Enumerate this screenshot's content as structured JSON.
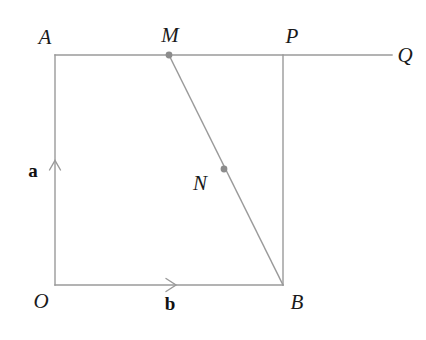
{
  "figure": {
    "background_color": "#ffffff",
    "line_color": "#9a9a9a",
    "point_color": "#8c8c8c",
    "label_color": "#1a1a1a",
    "line_width": 1.4,
    "point_radius": 3.4
  },
  "points": {
    "O": {
      "label": "O",
      "x": 55,
      "y": 285,
      "label_x": 41,
      "label_y": 301
    },
    "A": {
      "label": "A",
      "x": 55,
      "y": 55,
      "label_x": 45,
      "label_y": 37
    },
    "M": {
      "label": "M",
      "x": 169,
      "y": 55,
      "label_x": 170,
      "label_y": 35,
      "dot": true
    },
    "P": {
      "label": "P",
      "x": 283,
      "y": 55,
      "label_x": 292,
      "label_y": 36
    },
    "Q": {
      "label": "Q",
      "x": 392,
      "y": 55,
      "label_x": 405,
      "label_y": 55
    },
    "B": {
      "label": "B",
      "x": 283,
      "y": 285,
      "label_x": 297,
      "label_y": 302
    },
    "N": {
      "label": "N",
      "x": 224,
      "y": 169,
      "label_x": 200,
      "label_y": 183,
      "dot": true
    }
  },
  "segments": [
    {
      "name": "segment-OA",
      "x1": 55,
      "y1": 285,
      "x2": 55,
      "y2": 55
    },
    {
      "name": "segment-AQ",
      "x1": 55,
      "y1": 55,
      "x2": 392,
      "y2": 55
    },
    {
      "name": "segment-PB",
      "x1": 283,
      "y1": 55,
      "x2": 283,
      "y2": 285
    },
    {
      "name": "segment-OB",
      "x1": 55,
      "y1": 285,
      "x2": 283,
      "y2": 285
    },
    {
      "name": "segment-MB",
      "x1": 169,
      "y1": 55,
      "x2": 283,
      "y2": 285
    }
  ],
  "vectors": [
    {
      "name": "vector-a",
      "label": "a",
      "label_x": 33,
      "label_y": 170,
      "direction": "up",
      "arrow_x": 55,
      "arrow_y": 162
    },
    {
      "name": "vector-b",
      "label": "b",
      "label_x": 170,
      "label_y": 303,
      "direction": "right",
      "arrow_x": 175,
      "arrow_y": 285
    }
  ]
}
